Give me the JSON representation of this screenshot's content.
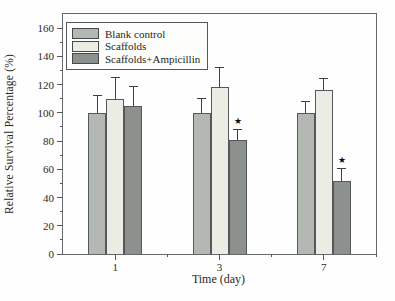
{
  "chart_data": {
    "type": "bar",
    "xlabel": "Time (day)",
    "ylabel": "Relative Survival Percentage (%)",
    "categories": [
      "1",
      "3",
      "7"
    ],
    "series": [
      {
        "name": "Blank control",
        "color": "#b4b8b2",
        "values": [
          100,
          100,
          100
        ],
        "errors": [
          12,
          10,
          8
        ]
      },
      {
        "name": "Scaffolds",
        "color": "#ebece3",
        "values": [
          110,
          118,
          116
        ],
        "errors": [
          15,
          14,
          8
        ]
      },
      {
        "name": "Scaffolds+Ampicillin",
        "color": "#8d918e",
        "values": [
          105,
          81,
          52
        ],
        "errors": [
          13,
          7,
          8
        ]
      }
    ],
    "significance_markers": [
      {
        "series_index": 2,
        "category_index": 1,
        "marker": "★"
      },
      {
        "series_index": 2,
        "category_index": 2,
        "marker": "★"
      }
    ],
    "ylim": [
      0,
      170
    ],
    "yticks_major": [
      0,
      20,
      40,
      60,
      80,
      100,
      120,
      140,
      160
    ],
    "ytick_minor_step": 10,
    "legend_position": "top-left",
    "grid": false,
    "error_bars": "upper-only"
  },
  "colors": {
    "axis": "#66696c",
    "tick": "#55585a",
    "text": "#2a2a2a",
    "error_bar": "#3d4143",
    "star": "#0d0d0d",
    "background": "#fefefe"
  }
}
